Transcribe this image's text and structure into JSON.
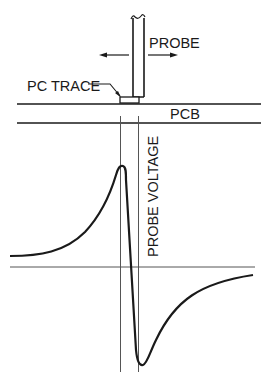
{
  "diagram": {
    "labels": {
      "probe": "PROBE",
      "pc_trace": "PC TRACE",
      "pcb": "PCB",
      "probe_voltage": "PROBE VOLTAGE"
    },
    "icons": {
      "left_arrow": "arrow-left-icon",
      "right_arrow": "arrow-right-icon"
    },
    "colors": {
      "ink": "#1a1a1a",
      "axis": "#555555",
      "background": "#ffffff"
    }
  }
}
